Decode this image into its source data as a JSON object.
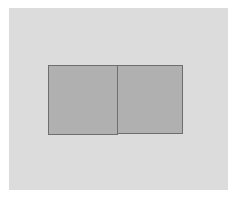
{
  "canvas": {
    "background": "#dcdcdc"
  },
  "shapes": [
    {
      "type": "rectangle",
      "fill": "#b0b0b0",
      "stroke": "#6e6e6e"
    },
    {
      "type": "rectangle",
      "fill": "#b0b0b0",
      "stroke": "#6e6e6e"
    }
  ]
}
